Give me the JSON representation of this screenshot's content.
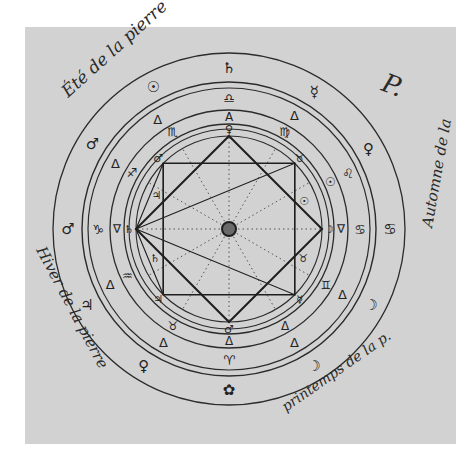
{
  "document": {
    "type": "alchemical astrological circle diagram",
    "background_color": "#d2d2d2",
    "ink_color": "#222222",
    "annotations": {
      "top_left": "Été de la pierre",
      "top_right": "Automne de la",
      "right_flourish": "P.",
      "bottom_left": "Hiver de la pierre",
      "bottom_right": "printemps de la p."
    },
    "ring_outer_symbols": [
      {
        "name": "saturn",
        "glyph": "♄",
        "angle": -90
      },
      {
        "name": "sun",
        "glyph": "☉",
        "angle": -118
      },
      {
        "name": "mars",
        "glyph": "♂",
        "angle": -148
      },
      {
        "name": "mars",
        "glyph": "♂",
        "angle": 180
      },
      {
        "name": "jupiter",
        "glyph": "♃",
        "angle": 152
      },
      {
        "name": "venus",
        "glyph": "♀",
        "angle": 122
      },
      {
        "name": "earth-rose",
        "glyph": "✿",
        "angle": 90
      },
      {
        "name": "moon",
        "glyph": "☽",
        "angle": 58
      },
      {
        "name": "moon",
        "glyph": "☽",
        "angle": 28
      },
      {
        "name": "venus",
        "glyph": "♀",
        "angle": -30
      },
      {
        "name": "mercury",
        "glyph": "☿",
        "angle": -58
      },
      {
        "name": "cancer",
        "glyph": "♋",
        "angle": 0
      }
    ],
    "ring_middle_symbols": [
      {
        "name": "libra",
        "glyph": "♎",
        "angle": -90
      },
      {
        "name": "delta",
        "glyph": "Δ",
        "angle": -123
      },
      {
        "name": "delta",
        "glyph": "Δ",
        "angle": -150
      },
      {
        "name": "capricorn",
        "glyph": "♑",
        "angle": 180
      },
      {
        "name": "delta",
        "glyph": "Δ",
        "angle": 155
      },
      {
        "name": "delta",
        "glyph": "Δ",
        "angle": 120
      },
      {
        "name": "aries",
        "glyph": "♈",
        "angle": 90
      },
      {
        "name": "delta",
        "glyph": "Δ",
        "angle": 60
      },
      {
        "name": "delta",
        "glyph": "Δ",
        "angle": 30
      },
      {
        "name": "cancer",
        "glyph": "♋",
        "angle": 0
      },
      {
        "name": "leo",
        "glyph": "♌",
        "angle": -25
      },
      {
        "name": "delta",
        "glyph": "Δ",
        "angle": -60
      }
    ],
    "ring_inner_symbols": [
      {
        "name": "A-mark",
        "glyph": "A",
        "angle": -90
      },
      {
        "name": "scorpio",
        "glyph": "♏",
        "angle": -120
      },
      {
        "name": "sagittarius",
        "glyph": "♐",
        "angle": -150
      },
      {
        "name": "delta-down",
        "glyph": "∇",
        "angle": 180
      },
      {
        "name": "aquarius",
        "glyph": "♒",
        "angle": 155
      },
      {
        "name": "taurus",
        "glyph": "♉",
        "angle": 120
      },
      {
        "name": "delta",
        "glyph": "Δ",
        "angle": 90
      },
      {
        "name": "delta",
        "glyph": "Δ",
        "angle": 60
      },
      {
        "name": "gemini",
        "glyph": "♊",
        "angle": 30
      },
      {
        "name": "delta-down",
        "glyph": "∇",
        "angle": 0
      },
      {
        "name": "sun",
        "glyph": "☉",
        "angle": -25
      },
      {
        "name": "virgo",
        "glyph": "♍",
        "angle": -60
      }
    ],
    "vertex_symbols": [
      {
        "name": "venus",
        "glyph": "♀",
        "angle": -90
      },
      {
        "name": "taurus",
        "glyph": "♉",
        "angle": -45
      },
      {
        "name": "moon",
        "glyph": "☽",
        "angle": 0
      },
      {
        "name": "mercury",
        "glyph": "☿",
        "angle": 45
      },
      {
        "name": "mars",
        "glyph": "♂",
        "angle": 90
      },
      {
        "name": "jupiter",
        "glyph": "♃",
        "angle": 135
      },
      {
        "name": "saturn",
        "glyph": "♄",
        "angle": 180
      },
      {
        "name": "mars",
        "glyph": "♂",
        "angle": -135
      }
    ],
    "interior_symbols": [
      {
        "name": "jupiter",
        "glyph": "♃",
        "angle": -155,
        "r": 80
      },
      {
        "name": "saturn",
        "glyph": "♄",
        "angle": 158,
        "r": 80
      },
      {
        "name": "sun",
        "glyph": "☉",
        "angle": -20,
        "r": 80
      },
      {
        "name": "taurus",
        "glyph": "♉",
        "angle": 22,
        "r": 80
      }
    ]
  }
}
